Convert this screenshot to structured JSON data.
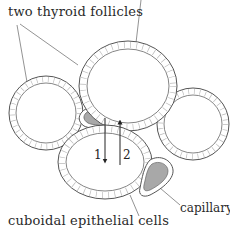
{
  "labels": {
    "follicles": "two thyroid follicles",
    "cells": "cuboidal epithelial cells",
    "capillary": "capillary"
  },
  "arrows": {
    "arrow_1": "1",
    "arrow_2": "2"
  },
  "colors": {
    "line": "#555555",
    "capillary_fill": "#a8a8a8",
    "background": "#ffffff"
  }
}
